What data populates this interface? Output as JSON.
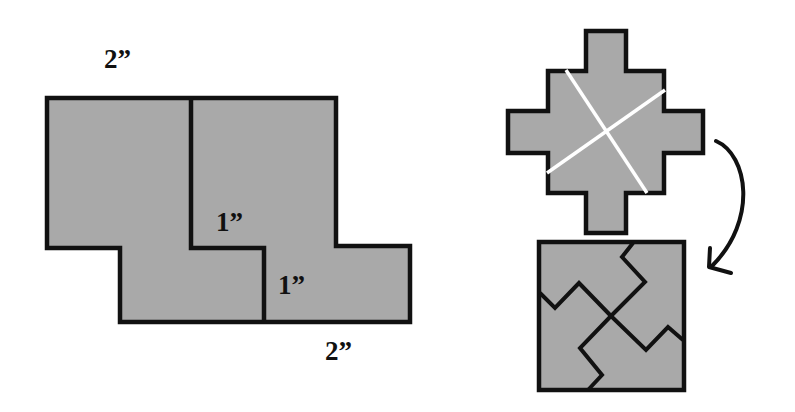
{
  "colors": {
    "fill": "#a9a9a9",
    "stroke": "#111111",
    "cut_line": "#ffffff"
  },
  "left_figure": {
    "labels": {
      "top_width": "2”",
      "inner_step_upper": "1”",
      "inner_step_lower": "1”",
      "bottom_width": "2”"
    }
  },
  "right_figure": {
    "cross_shape": "stepped-cross",
    "cut_lines": 2,
    "arrow": "curved-arrow-down",
    "result_shape": "square-of-four-pieces"
  }
}
